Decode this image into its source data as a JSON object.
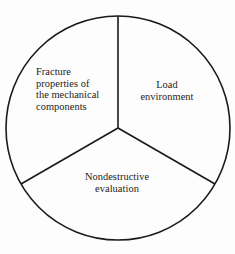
{
  "diagram": {
    "type": "three-sector-circle",
    "shape": "circle",
    "background_color": "#fdfdfd",
    "stroke_color": "#1a1a1a",
    "text_color": "#1b1b1b",
    "circle": {
      "center_x": 118,
      "center_y": 128,
      "radius": 112
    },
    "divider_lines": [
      {
        "name": "divider-up",
        "from": "center",
        "angle_deg": 90,
        "endpoint_x": 118,
        "endpoint_y": 16
      },
      {
        "name": "divider-down-left",
        "from": "center",
        "angle_deg": 210,
        "endpoint_x": 21,
        "endpoint_y": 184
      },
      {
        "name": "divider-down-right",
        "from": "center",
        "angle_deg": 330,
        "endpoint_x": 215,
        "endpoint_y": 184
      }
    ],
    "sectors": [
      {
        "id": "fracture",
        "position": "left",
        "text_align": "left",
        "label": "Fracture\nproperties of\nthe mechanical\ncomponents"
      },
      {
        "id": "load",
        "position": "right",
        "text_align": "center",
        "label": "Load\nenvironment"
      },
      {
        "id": "nondestructive",
        "position": "bottom",
        "text_align": "center",
        "label": "Nondestructive\nevaluation"
      }
    ]
  }
}
